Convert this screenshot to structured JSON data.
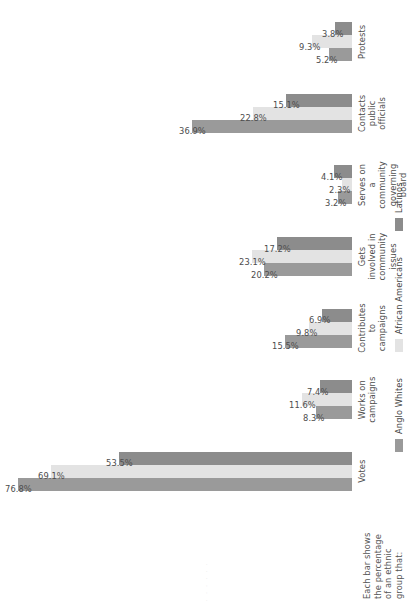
{
  "caption": {
    "lines": [
      "Each bar shows",
      "the percentage",
      "of an ethnic",
      "group that:"
    ],
    "text": "Each bar shows\nthe percentage\nof an ethnic\ngroup that:"
  },
  "colors": {
    "anglo_whites": "#9a9a9a",
    "african_americans": "#e3e3e3",
    "latinos": "#8c8c8c",
    "text": "#4d4d4d",
    "background": "#ffffff"
  },
  "edge_artifact": ". . . . . .",
  "chart_data": {
    "type": "bar",
    "title": "",
    "subtitle": "",
    "xlabel": "",
    "ylabel": "",
    "ylim": [
      0,
      80
    ],
    "grid": false,
    "legend_position": "bottom",
    "value_suffix": "%",
    "orientation": "vertical-rotated",
    "categories": [
      "Votes",
      "Works on campaigns",
      "Contributes to campaigns",
      "Gets involved in\ncommunity issues",
      "Serves on a community\ngoverning board",
      "Contacts public officials",
      "Protests"
    ],
    "series": [
      {
        "name": "Anglo Whites",
        "color": "#9a9a9a",
        "values": [
          76.8,
          8.3,
          15.5,
          20.2,
          3.2,
          36.9,
          5.2
        ],
        "labels": [
          "76.8%",
          "8.3%",
          "15.5%",
          "20.2%",
          "3.2%",
          "36.9%",
          "5.2%"
        ]
      },
      {
        "name": "African Americans",
        "color": "#e3e3e3",
        "values": [
          69.1,
          11.6,
          9.8,
          23.1,
          2.3,
          22.8,
          9.3
        ],
        "labels": [
          "69.1%",
          "11.6%",
          "9.8%",
          "23.1%",
          "2.3%",
          "22.8%",
          "9.3%"
        ]
      },
      {
        "name": "Latinos",
        "color": "#8c8c8c",
        "values": [
          53.5,
          7.4,
          6.9,
          17.2,
          4.1,
          15.1,
          3.8
        ],
        "labels": [
          "53.5%",
          "7.4%",
          "6.9%",
          "17.2%",
          "4.1%",
          "15.1%",
          "3.8%"
        ]
      }
    ]
  }
}
